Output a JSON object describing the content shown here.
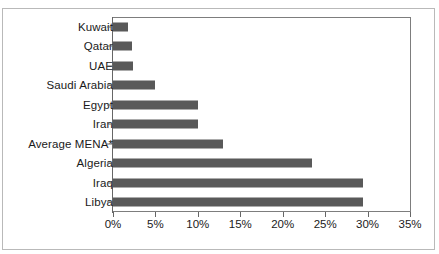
{
  "chart_data": {
    "type": "bar",
    "orientation": "horizontal",
    "title": "",
    "xlabel": "",
    "ylabel": "",
    "xlim": [
      0,
      35
    ],
    "xtick_labels": [
      "0%",
      "5%",
      "10%",
      "15%",
      "20%",
      "25%",
      "30%",
      "35%"
    ],
    "xtick_values": [
      0,
      5,
      10,
      15,
      20,
      25,
      30,
      35
    ],
    "grid": false,
    "legend": false,
    "bar_color": "#595959",
    "categories": [
      "Kuwait",
      "Qatar",
      "UAE",
      "Saudi Arabia",
      "Egypt",
      "Iran",
      "Average MENA*",
      "Algeria",
      "Iraq",
      "Libya"
    ],
    "values": [
      1.8,
      2.2,
      2.4,
      5.0,
      10.0,
      10.0,
      13.0,
      23.5,
      29.5,
      29.5
    ]
  }
}
